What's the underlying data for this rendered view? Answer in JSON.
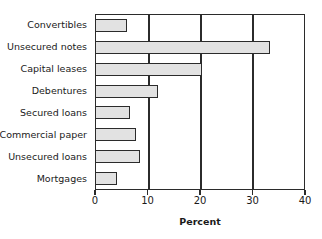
{
  "chart_data": {
    "type": "bar",
    "orientation": "horizontal",
    "title": "",
    "xlabel": "Percent",
    "ylabel": "",
    "categories": [
      "Convertibles",
      "Unsecured notes",
      "Capital leases",
      "Debentures",
      "Secured loans",
      "Commercial paper",
      "Unsecured loans",
      "Mortgages"
    ],
    "values": [
      6.1,
      33.7,
      20.6,
      12.1,
      6.7,
      7.8,
      8.6,
      4.2
    ],
    "xlim": [
      0,
      40
    ],
    "xticks": [
      0,
      10,
      20,
      30,
      40
    ],
    "xtick_labels": [
      "0",
      "10",
      "20",
      "30",
      "40"
    ],
    "gridlines": [
      10,
      20,
      30
    ],
    "grid": true,
    "legend": false,
    "bar_fill_color": "#e2e2e2",
    "bar_edge_color": "#2b2b2b",
    "axis_color": "#2b2b2b",
    "background_color": "#ffffff"
  }
}
